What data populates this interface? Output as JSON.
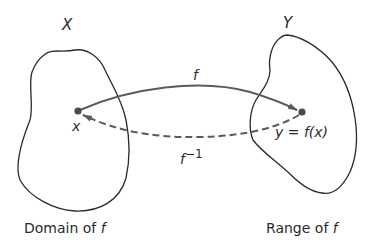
{
  "sets": {
    "domain": {
      "name": "X",
      "caption": "Domain of",
      "caption_var": "f"
    },
    "range": {
      "name": "Y",
      "caption": "Range of",
      "caption_var": "f"
    }
  },
  "points": {
    "x": {
      "label": "x"
    },
    "y": {
      "label": "y = f(x)"
    }
  },
  "arrows": {
    "forward": {
      "label": "f",
      "style": "solid"
    },
    "inverse": {
      "label": "f",
      "superscript": "−1",
      "style": "dashed"
    }
  },
  "colors": {
    "stroke": "#2a2a2a",
    "arrow": "#5a5a5a",
    "background": "#ffffff"
  }
}
